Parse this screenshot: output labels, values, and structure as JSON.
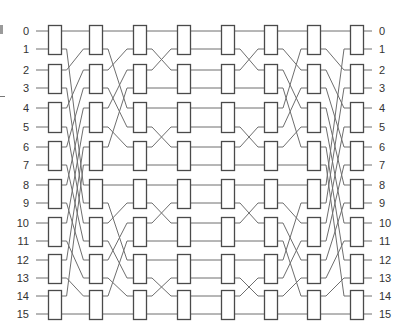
{
  "network": {
    "inputs": 16,
    "left_labels": [
      "0",
      "1",
      "2",
      "3",
      "4",
      "5",
      "6",
      "7",
      "8",
      "9",
      "10",
      "11",
      "12",
      "13",
      "14",
      "15"
    ],
    "right_labels": [
      "0",
      "1",
      "2",
      "3",
      "4",
      "5",
      "6",
      "7",
      "8",
      "9",
      "10",
      "11",
      "12",
      "13",
      "14",
      "15"
    ],
    "line_y": [
      31,
      49,
      70,
      88,
      108,
      127,
      147,
      165,
      185,
      203,
      223,
      241,
      260,
      278,
      296,
      314
    ],
    "columns_x": [
      48,
      89,
      133,
      177,
      221,
      264,
      307,
      350
    ],
    "box_width": 13,
    "stages": 8,
    "switches_per_stage": 8,
    "gaps": [
      {
        "name": "unshuffle-16",
        "perm": [
          0,
          8,
          1,
          9,
          2,
          10,
          3,
          11,
          4,
          12,
          5,
          13,
          6,
          14,
          7,
          15
        ]
      },
      {
        "name": "unshuffle-8",
        "perm": [
          0,
          4,
          1,
          5,
          2,
          6,
          3,
          7,
          8,
          12,
          9,
          13,
          10,
          14,
          11,
          15
        ]
      },
      {
        "name": "unshuffle-4",
        "perm": [
          0,
          2,
          1,
          3,
          4,
          6,
          5,
          7,
          8,
          10,
          9,
          11,
          12,
          14,
          13,
          15
        ]
      },
      {
        "name": "straight",
        "perm": [
          0,
          1,
          2,
          3,
          4,
          5,
          6,
          7,
          8,
          9,
          10,
          11,
          12,
          13,
          14,
          15
        ]
      },
      {
        "name": "shuffle-4",
        "perm": [
          0,
          2,
          1,
          3,
          4,
          6,
          5,
          7,
          8,
          10,
          9,
          11,
          12,
          14,
          13,
          15
        ]
      },
      {
        "name": "shuffle-8",
        "perm": [
          0,
          2,
          4,
          6,
          1,
          3,
          5,
          7,
          8,
          10,
          12,
          14,
          9,
          11,
          13,
          15
        ]
      },
      {
        "name": "shuffle-16",
        "perm": [
          0,
          2,
          4,
          6,
          8,
          10,
          12,
          14,
          1,
          3,
          5,
          7,
          9,
          11,
          13,
          15
        ]
      }
    ]
  },
  "colors": {
    "line": "#6e6e6e",
    "box_stroke": "#4a4a4a",
    "box_fill": "#ffffff",
    "label": "#333333"
  }
}
